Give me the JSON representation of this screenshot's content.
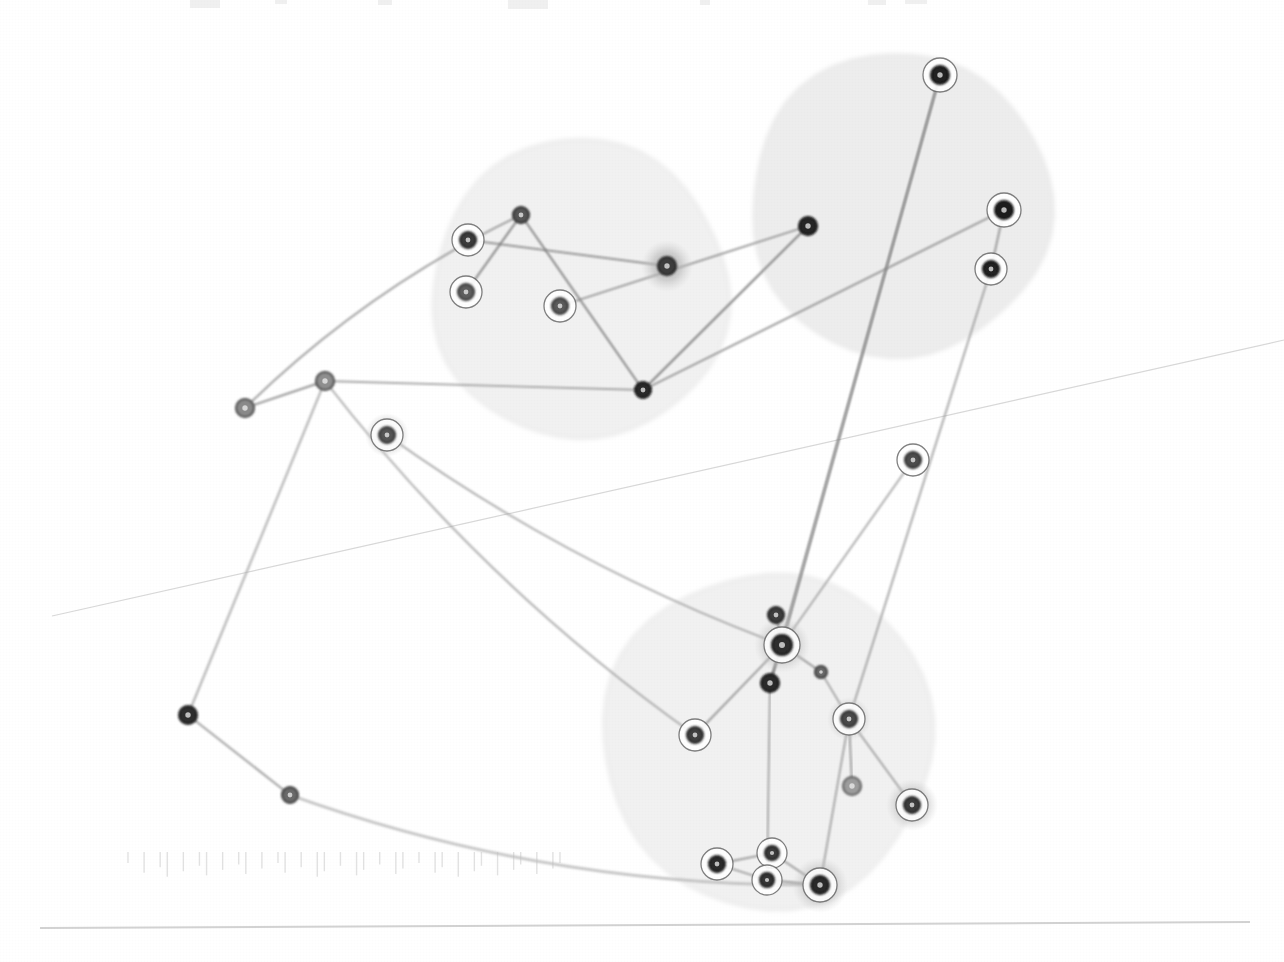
{
  "figure": {
    "title": "",
    "background_color": "#ffffff",
    "width": 1284,
    "height": 962,
    "style_note": "scanned network graph on white paper"
  },
  "chart_data": {
    "type": "scatter",
    "subtype": "node-link-network-graph",
    "title": "",
    "subtitle": "",
    "xlabel": "",
    "ylabel": "",
    "xlim": [
      0,
      1284
    ],
    "ylim": [
      0,
      962
    ],
    "grid": false,
    "legend": null,
    "palette": {
      "node_fill_dark": "#2b2b2b",
      "node_fill_mid": "#6e6e6e",
      "node_fill_light": "#9a9a9a",
      "node_ring_white": "#ffffff",
      "node_ring_stroke": "#555555",
      "halo_gray": "#b9b9b9",
      "edge_gray": "#8d8d8d",
      "edge_gray_light": "#b5b5b5",
      "cluster_fill": "#ededed",
      "cluster_stroke": "#dcdcdc",
      "artifact_gray": "#d6d6d6"
    },
    "clusters": [
      {
        "id": "cluster-left",
        "label": "",
        "cx": 580,
        "cy": 290,
        "rx": 148,
        "ry": 150,
        "rotate": -6,
        "fill": "#eeeeee",
        "opacity": 0.85
      },
      {
        "id": "cluster-topright",
        "label": "",
        "cx": 900,
        "cy": 205,
        "rx": 150,
        "ry": 152,
        "rotate": 4,
        "fill": "#ebebeb",
        "opacity": 0.9
      },
      {
        "id": "cluster-bottom",
        "label": "",
        "cx": 768,
        "cy": 740,
        "rx": 165,
        "ry": 168,
        "rotate": 0,
        "fill": "#eeeeee",
        "opacity": 0.85
      }
    ],
    "nodes": [
      {
        "id": "n1",
        "x": 245,
        "y": 408,
        "r": 9,
        "fill": "#8a8a8a",
        "stroke": "#4a4a4a",
        "ring": false,
        "halo": 0,
        "cluster": null
      },
      {
        "id": "n2",
        "x": 325,
        "y": 381,
        "r": 9,
        "fill": "#8f8f8f",
        "stroke": "#454545",
        "ring": false,
        "halo": 0,
        "cluster": null
      },
      {
        "id": "n3",
        "x": 387,
        "y": 435,
        "r": 8,
        "fill": "#555555",
        "stroke": "#2d2d2d",
        "ring": true,
        "halo": 22,
        "cluster": null
      },
      {
        "id": "n4",
        "x": 188,
        "y": 715,
        "r": 9,
        "fill": "#2f2f2f",
        "stroke": "#1c1c1c",
        "ring": false,
        "halo": 0,
        "cluster": null
      },
      {
        "id": "n5",
        "x": 290,
        "y": 795,
        "r": 8,
        "fill": "#6a6a6a",
        "stroke": "#3a3a3a",
        "ring": false,
        "halo": 0,
        "cluster": null
      },
      {
        "id": "n6",
        "x": 468,
        "y": 240,
        "r": 8,
        "fill": "#3a3a3a",
        "stroke": "#1f1f1f",
        "ring": true,
        "halo": 0,
        "cluster": "cluster-left"
      },
      {
        "id": "n7",
        "x": 466,
        "y": 292,
        "r": 8,
        "fill": "#5e5e5e",
        "stroke": "#303030",
        "ring": true,
        "halo": 0,
        "cluster": "cluster-left"
      },
      {
        "id": "n8",
        "x": 521,
        "y": 215,
        "r": 8,
        "fill": "#565656",
        "stroke": "#2a2a2a",
        "ring": false,
        "halo": 0,
        "cluster": "cluster-left"
      },
      {
        "id": "n9",
        "x": 560,
        "y": 306,
        "r": 8,
        "fill": "#5a5a5a",
        "stroke": "#2c2c2c",
        "ring": true,
        "halo": 0,
        "cluster": "cluster-left"
      },
      {
        "id": "n10",
        "x": 667,
        "y": 266,
        "r": 9,
        "fill": "#3d3d3d",
        "stroke": "#222222",
        "ring": false,
        "halo": 26,
        "cluster": "cluster-left"
      },
      {
        "id": "n11",
        "x": 643,
        "y": 390,
        "r": 8,
        "fill": "#2b2b2b",
        "stroke": "#151515",
        "ring": false,
        "halo": 0,
        "cluster": "cluster-left"
      },
      {
        "id": "n12",
        "x": 940,
        "y": 75,
        "r": 9,
        "fill": "#222222",
        "stroke": "#101010",
        "ring": true,
        "halo": 0,
        "cluster": "cluster-topright"
      },
      {
        "id": "n13",
        "x": 808,
        "y": 226,
        "r": 9,
        "fill": "#262626",
        "stroke": "#121212",
        "ring": false,
        "halo": 0,
        "cluster": "cluster-topright"
      },
      {
        "id": "n14",
        "x": 1004,
        "y": 210,
        "r": 9,
        "fill": "#1f1f1f",
        "stroke": "#0d0d0d",
        "ring": true,
        "halo": 0,
        "cluster": "cluster-topright"
      },
      {
        "id": "n15",
        "x": 991,
        "y": 269,
        "r": 8,
        "fill": "#242424",
        "stroke": "#101010",
        "ring": true,
        "halo": 0,
        "cluster": "cluster-topright"
      },
      {
        "id": "n16",
        "x": 913,
        "y": 460,
        "r": 8,
        "fill": "#4e4e4e",
        "stroke": "#2a2a2a",
        "ring": true,
        "halo": 0,
        "cluster": null
      },
      {
        "id": "n17",
        "x": 776,
        "y": 615,
        "r": 8,
        "fill": "#3c3c3c",
        "stroke": "#1e1e1e",
        "ring": false,
        "halo": 0,
        "cluster": "cluster-bottom"
      },
      {
        "id": "n18",
        "x": 782,
        "y": 645,
        "r": 10,
        "fill": "#2e2e2e",
        "stroke": "#161616",
        "ring": true,
        "halo": 28,
        "cluster": "cluster-bottom"
      },
      {
        "id": "n19",
        "x": 770,
        "y": 683,
        "r": 9,
        "fill": "#2a2a2a",
        "stroke": "#131313",
        "ring": false,
        "halo": 0,
        "cluster": "cluster-bottom"
      },
      {
        "id": "n20",
        "x": 821,
        "y": 672,
        "r": 6,
        "fill": "#6b6b6b",
        "stroke": "#3a3a3a",
        "ring": false,
        "halo": 0,
        "cluster": "cluster-bottom"
      },
      {
        "id": "n21",
        "x": 695,
        "y": 735,
        "r": 8,
        "fill": "#3f3f3f",
        "stroke": "#1f1f1f",
        "ring": true,
        "halo": 0,
        "cluster": "cluster-bottom"
      },
      {
        "id": "n22",
        "x": 849,
        "y": 719,
        "r": 8,
        "fill": "#4a4a4a",
        "stroke": "#252525",
        "ring": true,
        "halo": 22,
        "cluster": "cluster-bottom"
      },
      {
        "id": "n23",
        "x": 852,
        "y": 786,
        "r": 9,
        "fill": "#9d9d9d",
        "stroke": "#5c5c5c",
        "ring": false,
        "halo": 0,
        "cluster": "cluster-bottom"
      },
      {
        "id": "n24",
        "x": 912,
        "y": 805,
        "r": 8,
        "fill": "#3b3b3b",
        "stroke": "#1d1d1d",
        "ring": true,
        "halo": 26,
        "cluster": "cluster-bottom"
      },
      {
        "id": "n25",
        "x": 772,
        "y": 853,
        "r": 7,
        "fill": "#3a3a3a",
        "stroke": "#1c1c1c",
        "ring": true,
        "halo": 0,
        "cluster": "cluster-bottom"
      },
      {
        "id": "n26",
        "x": 717,
        "y": 864,
        "r": 8,
        "fill": "#2c2c2c",
        "stroke": "#141414",
        "ring": true,
        "halo": 0,
        "cluster": "cluster-bottom"
      },
      {
        "id": "n27",
        "x": 767,
        "y": 880,
        "r": 7,
        "fill": "#343434",
        "stroke": "#181818",
        "ring": true,
        "halo": 0,
        "cluster": "cluster-bottom"
      },
      {
        "id": "n28",
        "x": 820,
        "y": 885,
        "r": 9,
        "fill": "#2a2a2a",
        "stroke": "#131313",
        "ring": true,
        "halo": 28,
        "cluster": "cluster-bottom"
      }
    ],
    "edges": [
      {
        "source": "n1",
        "target": "n2",
        "width": 2.0,
        "color": "#8d8d8d",
        "curve": 0
      },
      {
        "source": "n1",
        "target": "n8",
        "width": 2.0,
        "color": "#9a9a9a",
        "curve": -28
      },
      {
        "source": "n2",
        "target": "n4",
        "width": 2.2,
        "color": "#b0b0b0",
        "curve": 0
      },
      {
        "source": "n2",
        "target": "n21",
        "width": 2.0,
        "color": "#a8a8a8",
        "curve": 38
      },
      {
        "source": "n2",
        "target": "n11",
        "width": 1.8,
        "color": "#9e9e9e",
        "curve": 0
      },
      {
        "source": "n4",
        "target": "n5",
        "width": 2.0,
        "color": "#9c9c9c",
        "curve": 0
      },
      {
        "source": "n5",
        "target": "n28",
        "width": 2.6,
        "color": "#bdbdbd",
        "curve": 48
      },
      {
        "source": "n3",
        "target": "n18",
        "width": 1.8,
        "color": "#a0a0a0",
        "curve": 30
      },
      {
        "source": "n6",
        "target": "n10",
        "width": 2.0,
        "color": "#8d8d8d",
        "curve": 0
      },
      {
        "source": "n7",
        "target": "n8",
        "width": 2.0,
        "color": "#7f7f7f",
        "curve": 0
      },
      {
        "source": "n8",
        "target": "n11",
        "width": 2.0,
        "color": "#808080",
        "curve": 0
      },
      {
        "source": "n9",
        "target": "n13",
        "width": 1.8,
        "color": "#8a8a8a",
        "curve": 0
      },
      {
        "source": "n11",
        "target": "n13",
        "width": 2.0,
        "color": "#7d7d7d",
        "curve": 0
      },
      {
        "source": "n11",
        "target": "n14",
        "width": 1.8,
        "color": "#8a8a8a",
        "curve": 0
      },
      {
        "source": "n12",
        "target": "n18",
        "width": 1.8,
        "color": "#818181",
        "curve": 0
      },
      {
        "source": "n12",
        "target": "n19",
        "width": 1.8,
        "color": "#8a8a8a",
        "curve": 0
      },
      {
        "source": "n14",
        "target": "n15",
        "width": 1.8,
        "color": "#8a8a8a",
        "curve": 0
      },
      {
        "source": "n15",
        "target": "n22",
        "width": 1.8,
        "color": "#9a9a9a",
        "curve": 0
      },
      {
        "source": "n16",
        "target": "n18",
        "width": 1.8,
        "color": "#a0a0a0",
        "curve": 0
      },
      {
        "source": "n17",
        "target": "n18",
        "width": 1.8,
        "color": "#6f6f6f",
        "curve": 0
      },
      {
        "source": "n18",
        "target": "n19",
        "width": 1.8,
        "color": "#6f6f6f",
        "curve": 0
      },
      {
        "source": "n18",
        "target": "n20",
        "width": 1.6,
        "color": "#8a8a8a",
        "curve": 0
      },
      {
        "source": "n18",
        "target": "n21",
        "width": 1.8,
        "color": "#8f8f8f",
        "curve": 0
      },
      {
        "source": "n19",
        "target": "n27",
        "width": 1.8,
        "color": "#9a9a9a",
        "curve": 0
      },
      {
        "source": "n20",
        "target": "n22",
        "width": 1.6,
        "color": "#9a9a9a",
        "curve": 0
      },
      {
        "source": "n22",
        "target": "n23",
        "width": 1.8,
        "color": "#8f8f8f",
        "curve": 0
      },
      {
        "source": "n22",
        "target": "n28",
        "width": 1.8,
        "color": "#9a9a9a",
        "curve": 0
      },
      {
        "source": "n24",
        "target": "n22",
        "width": 1.8,
        "color": "#9a9a9a",
        "curve": 0
      },
      {
        "source": "n25",
        "target": "n26",
        "width": 1.8,
        "color": "#909090",
        "curve": 0
      },
      {
        "source": "n25",
        "target": "n28",
        "width": 1.8,
        "color": "#909090",
        "curve": 0
      },
      {
        "source": "n26",
        "target": "n27",
        "width": 1.8,
        "color": "#909090",
        "curve": 0
      },
      {
        "source": "n27",
        "target": "n28",
        "width": 1.8,
        "color": "#909090",
        "curve": 0
      }
    ],
    "artifacts": {
      "faint_diagonal_line": {
        "x1": 52,
        "y1": 616,
        "x2": 1284,
        "y2": 340,
        "color": "#d8d8d8",
        "width": 1.2
      },
      "page_baseline": {
        "x1": 40,
        "y1": 928,
        "x2": 1250,
        "y2": 922,
        "color": "#d2d2d2",
        "width": 2.0
      },
      "tick_marks": {
        "x_start": 128,
        "x_end": 560,
        "y": 852,
        "height": 22,
        "count": 34,
        "color": "#e2e2e2"
      },
      "top_smudges": {
        "y": 4,
        "color": "#ececec"
      }
    }
  }
}
